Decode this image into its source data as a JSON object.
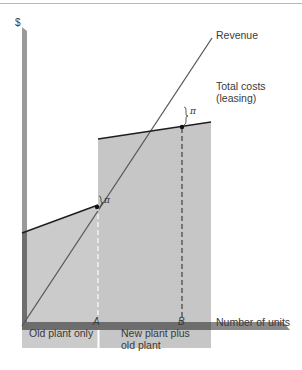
{
  "diagram": {
    "y_axis_label": "$",
    "x_axis_label": "Number of units",
    "curves": {
      "revenue": "Revenue",
      "total_costs_line1": "Total costs",
      "total_costs_line2": "(leasing)"
    },
    "points": {
      "a": "A",
      "b": "B"
    },
    "profit_symbol": "π",
    "regions": {
      "old_plant": "Old plant only",
      "new_plant_line1": "New plant plus",
      "new_plant_line2": "old plant"
    },
    "colors": {
      "shade": "#c9c9c9",
      "axis_light": "#a8a8a8",
      "axis_dark": "#7d7d7d",
      "line": "#222222",
      "revenue_line": "#555555"
    }
  }
}
